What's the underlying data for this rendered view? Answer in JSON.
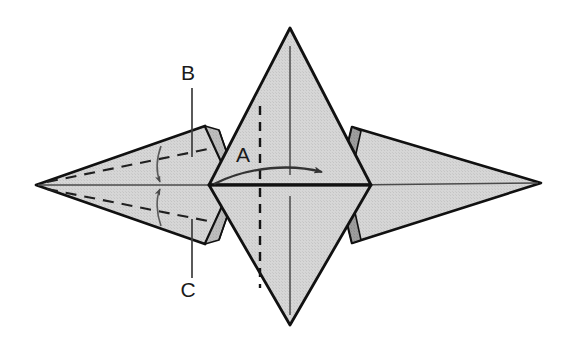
{
  "figure": {
    "kind": "origami-fold-diagram",
    "title": "",
    "background_color": "#ffffff",
    "outline_color": "#111111",
    "face_fill_light": "#d4d4d4",
    "face_fill_mid": "#c2c2c2",
    "face_fill_dark": "#9a9a9a",
    "face_fill_darker": "#8a8a8a",
    "crease_line_color": "#555555",
    "dashed_line_color": "#222222",
    "arrow_color": "#3a3a3a",
    "leader_line_color": "#444444"
  },
  "labels": [
    {
      "id": "A",
      "text": "A",
      "x": 243,
      "y": 162
    },
    {
      "id": "B",
      "text": "B",
      "x": 181,
      "y": 80
    },
    {
      "id": "C",
      "text": "C",
      "x": 181,
      "y": 296
    }
  ],
  "leaders": [
    {
      "id": "leader-b",
      "for": "B",
      "x1": 192,
      "y1": 88,
      "x2": 192,
      "y2": 157
    },
    {
      "id": "leader-c",
      "for": "C",
      "x1": 192,
      "y1": 278,
      "x2": 192,
      "y2": 219
    }
  ],
  "geometry": {
    "center_x": 290,
    "center_y": 184,
    "left_vertex": {
      "x": 36,
      "y": 185
    },
    "right_vertex": {
      "x": 541,
      "y": 183
    },
    "top_vertex": {
      "x": 290,
      "y": 28
    },
    "bottom_vertex": {
      "x": 290,
      "y": 325
    }
  },
  "annotations": {
    "center_arrow": "curved-arrow-pointing-right",
    "left_arrows": "paired-curved-arrows-converging-on-axis",
    "dashed_axis": "vertical-dashed-fold-line-through-A",
    "solid_axis": "vertical-solid-crease-line"
  }
}
